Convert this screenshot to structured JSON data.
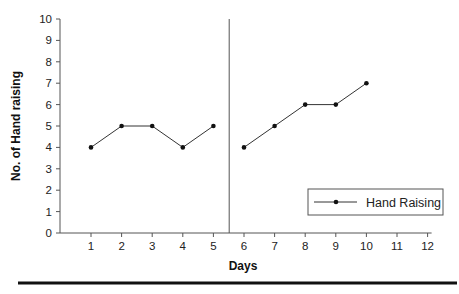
{
  "chart_data": {
    "type": "line",
    "title": "",
    "xlabel": "Days",
    "ylabel": "No. of Hand raising",
    "x_ticks": [
      1,
      2,
      3,
      4,
      5,
      6,
      7,
      8,
      9,
      10,
      11,
      12
    ],
    "y_ticks": [
      0,
      1,
      2,
      3,
      4,
      5,
      6,
      7,
      8,
      9,
      10
    ],
    "xlim": [
      0,
      12.5
    ],
    "ylim": [
      0,
      10
    ],
    "grid": false,
    "legend_position": "lower right",
    "phase_change_line_x": 5.5,
    "series": [
      {
        "name": "Hand Raising",
        "segments": [
          {
            "x": [
              1,
              2,
              3,
              4,
              5
            ],
            "y": [
              4,
              5,
              5,
              4,
              5
            ]
          },
          {
            "x": [
              6,
              7,
              8,
              9,
              10
            ],
            "y": [
              4,
              5,
              6,
              6,
              7
            ]
          }
        ]
      }
    ]
  },
  "legend": {
    "label": "Hand Raising"
  },
  "colors": {
    "line": "#333333",
    "axis": "#555555",
    "bottom_rule": "#111111"
  }
}
